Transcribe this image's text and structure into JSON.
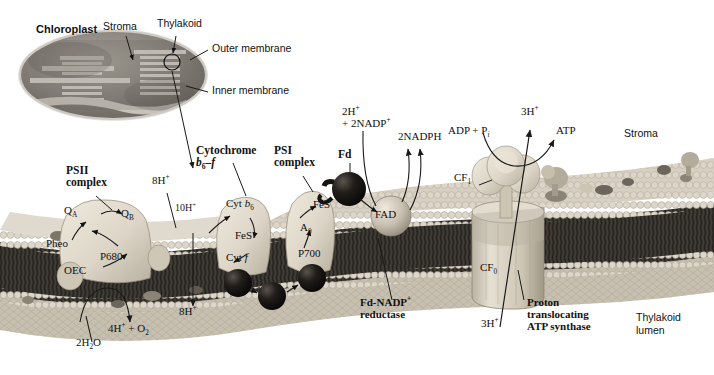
{
  "inset": {
    "chloroplast_label": "Chloroplast",
    "stroma_label": "Stroma",
    "thylakoid_label": "Thylakoid",
    "outer_membrane_label": "Outer membrane",
    "inner_membrane_label": "Inner membrane"
  },
  "complexes": {
    "psii_line1": "PSII",
    "psii_line2": "complex",
    "cytochrome_line1": "Cytochrome",
    "cytochrome_line2_a": "b",
    "cytochrome_line2_sub": "6",
    "cytochrome_line2_b": "–f",
    "psi_line1": "PSI",
    "psi_line2": "complex",
    "fd_label": "Fd",
    "fd_nadp_line1_a": "Fd",
    "fd_nadp_line1_b": "-NADP",
    "fd_nadp_line1_sup": "+",
    "fd_nadp_line2": "reductase",
    "atp_synthase_line1": "Proton",
    "atp_synthase_line2": "translocating",
    "atp_synthase_line3": "ATP synthase"
  },
  "cofactors": {
    "qa_a": "Q",
    "qa_sub": "A",
    "qb_a": "Q",
    "qb_sub": "B",
    "pheo": "Pheo",
    "p680": "P680",
    "oec": "OEC",
    "cyt_b6_a": "Cyt ",
    "cyt_b6_b": "b",
    "cyt_b6_sub": "6",
    "fes_bf": "FeS",
    "cyt_f_a": "Cyt ",
    "cyt_f_b": "f",
    "fes_psi": "FeS",
    "a0_a": "A",
    "a0_sub": "0",
    "p700": "P700",
    "fad": "FAD",
    "cf1_a": "CF",
    "cf1_sub": "1",
    "cf0_a": "CF",
    "cf0_sub": "0"
  },
  "reactions": {
    "h8_psii": "8H",
    "h8_psii_sup": "+",
    "h10": "10H",
    "h10_sup": "+",
    "h8_lumen": "8H",
    "h8_lumen_sup": "+",
    "water": "2H",
    "water_sub": "2",
    "water_b": "O",
    "oxygen_a": "4H",
    "oxygen_sup": "+",
    "oxygen_b": " + O",
    "oxygen_sub": "2",
    "nadp_line1_a": "2H",
    "nadp_line1_sup": "+",
    "nadp_line2_a": "+ 2NADP",
    "nadp_line2_sup": "+",
    "nadph": "2NADPH",
    "adp_a": "ADP + P",
    "adp_sub": "i",
    "atp": "ATP",
    "h3_top": "3H",
    "h3_top_sup": "+",
    "h3_bottom": "3H",
    "h3_bottom_sup": "+"
  },
  "compartments": {
    "stroma_right": "Stroma",
    "lumen_line1": "Thylakoid",
    "lumen_line2": "lumen"
  },
  "colors": {
    "ink": "#1a1a1a",
    "membrane_dark": "#3a3632",
    "headgroup": "#cfc8bc",
    "protein_light": "#ded8cc",
    "sphere_dark": "#151311",
    "inset_body": "#8e8a84"
  }
}
